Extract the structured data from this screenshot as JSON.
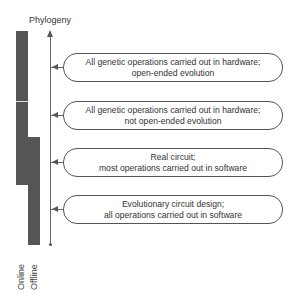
{
  "diagram": {
    "axis_label": "Phylogeny",
    "bars": [
      {
        "label": "Online",
        "color": "#555555"
      },
      {
        "label": "Offline",
        "color": "#555555"
      }
    ],
    "levels": [
      {
        "line1": "All genetic operations carried out in hardware;",
        "line2": "open-ended evolution"
      },
      {
        "line1": "All genetic operations carried out in hardware;",
        "line2": "not open-ended evolution"
      },
      {
        "line1": "Real circuit;",
        "line2": "most operations carried out in software"
      },
      {
        "line1": "Evolutionary circuit design;",
        "line2": "all operations carried out in software"
      }
    ]
  }
}
